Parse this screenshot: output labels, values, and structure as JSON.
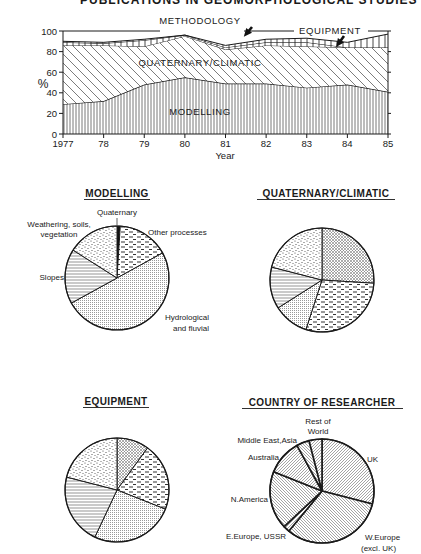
{
  "page": {
    "cropped_title": "PUBLICATIONS IN GEOMORPHOLOGICAL STUDIES"
  },
  "chart_data": [
    {
      "type": "area",
      "stacked": true,
      "title": "",
      "xlabel": "Year",
      "ylabel": "%",
      "ylim": [
        0,
        100
      ],
      "yticks": [
        0,
        20,
        40,
        60,
        80,
        100
      ],
      "categories": [
        "1977",
        "78",
        "79",
        "80",
        "81",
        "82",
        "83",
        "84",
        "85"
      ],
      "grid": false,
      "series": [
        {
          "name": "MODELLING",
          "pattern": "vertical-lines",
          "values": [
            29,
            32,
            48,
            55,
            49,
            49,
            45,
            48,
            41
          ]
        },
        {
          "name": "QUATERNARY/CLIMATIC",
          "pattern": "diagonal-lines",
          "values": [
            57,
            54,
            37,
            40,
            33,
            37,
            40,
            36,
            43
          ]
        },
        {
          "name": "METHODOLOGY",
          "pattern": "vertical-lines-band",
          "values": [
            3,
            2,
            6,
            1,
            2,
            3,
            4,
            0,
            0
          ]
        },
        {
          "name": "EQUIPMENT",
          "pattern": "vertical-lines-band",
          "values": [
            1,
            1,
            1,
            0,
            2,
            3,
            4,
            5,
            13
          ]
        }
      ],
      "cumulative_tops": {
        "MODELLING": [
          29,
          32,
          48,
          55,
          49,
          49,
          45,
          48,
          41
        ],
        "QUATERNARY/CLIMATIC": [
          86,
          86,
          85,
          95,
          82,
          86,
          85,
          84,
          84
        ],
        "METHODOLOGY": [
          89,
          88,
          91,
          96,
          84,
          89,
          89,
          84,
          84
        ],
        "EQUIPMENT": [
          90,
          89,
          92,
          96,
          86,
          92,
          93,
          89,
          97
        ]
      },
      "annotations": [
        {
          "text": "METHODOLOGY",
          "arrow": true
        },
        {
          "text": "EQUIPMENT",
          "arrow": true
        },
        {
          "text": "QUATERNARY/CLIMATIC",
          "arrow": false
        },
        {
          "text": "MODELLING",
          "arrow": false
        }
      ]
    },
    {
      "type": "pie",
      "title": "MODELLING",
      "slices": [
        {
          "label": "Quaternary",
          "value": 1,
          "pattern": "solid"
        },
        {
          "label": "Other processes",
          "value": 16,
          "pattern": "dashes"
        },
        {
          "label": "Hydrological and fluvial",
          "value": 50,
          "pattern": "fine-dots"
        },
        {
          "label": "Slopes",
          "value": 17,
          "pattern": "horizontal-lines"
        },
        {
          "label": "Weathering, soils, vegetation",
          "value": 16,
          "pattern": "stipple"
        }
      ]
    },
    {
      "type": "pie",
      "title": "QUATERNARY/CLIMATIC",
      "slices": [
        {
          "label": "Quaternary",
          "value": 26,
          "pattern": "crosshatch"
        },
        {
          "label": "Other processes",
          "value": 29,
          "pattern": "dashes"
        },
        {
          "label": "Hydrological and fluvial",
          "value": 11,
          "pattern": "fine-dots"
        },
        {
          "label": "Slopes",
          "value": 13,
          "pattern": "horizontal-lines"
        },
        {
          "label": "Weathering, soils, vegetation",
          "value": 21,
          "pattern": "stipple"
        }
      ]
    },
    {
      "type": "pie",
      "title": "EQUIPMENT",
      "slices": [
        {
          "label": "Quaternary",
          "value": 10,
          "pattern": "crosshatch"
        },
        {
          "label": "Other processes",
          "value": 21,
          "pattern": "dashes"
        },
        {
          "label": "Hydrological and fluvial",
          "value": 26,
          "pattern": "fine-dots"
        },
        {
          "label": "Slopes",
          "value": 22,
          "pattern": "horizontal-lines"
        },
        {
          "label": "Weathering, soils, vegetation",
          "value": 21,
          "pattern": "stipple"
        }
      ]
    },
    {
      "type": "pie",
      "title": "COUNTRY OF RESEARCHER",
      "slices": [
        {
          "label": "UK",
          "value": 29,
          "pattern": "diagonal-fine"
        },
        {
          "label": "W.Europe (excl. UK)",
          "value": 32,
          "pattern": "diagonal-fine"
        },
        {
          "label": "E.Europe, USSR",
          "value": 2,
          "pattern": "diagonal-fine"
        },
        {
          "label": "N.America",
          "value": 18,
          "pattern": "diagonal-fine"
        },
        {
          "label": "Australia",
          "value": 11,
          "pattern": "diagonal-fine"
        },
        {
          "label": "Middle East,Asia",
          "value": 4,
          "pattern": "diagonal-fine"
        },
        {
          "label": "Rest of World",
          "value": 4,
          "pattern": "diagonal-fine"
        }
      ]
    }
  ],
  "labels": {
    "area": {
      "methodology": "METHODOLOGY",
      "equipment": "EQUIPMENT",
      "quaternary": "QUATERNARY/CLIMATIC",
      "modelling": "MODELLING",
      "ylabel": "%",
      "xlabel": "Year"
    },
    "modelling_pie": {
      "title": "MODELLING",
      "quaternary": "Quaternary",
      "weathering_1": "Weathering, soils,",
      "weathering_2": "vegetation",
      "other": "Other processes",
      "slopes": "Slopes",
      "hydro_1": "Hydrological",
      "hydro_2": "and fluvial"
    },
    "quaternary_pie": {
      "title": "QUATERNARY/CLIMATIC"
    },
    "equipment_pie": {
      "title": "EQUIPMENT"
    },
    "country_pie": {
      "title": "COUNTRY OF RESEARCHER",
      "rest_1": "Rest of",
      "rest_2": "World",
      "mideast": "Middle East,Asia",
      "australia": "Australia",
      "namerica": "N.America",
      "eeurope": "E.Europe, USSR",
      "weurope_1": "W.Europe",
      "weurope_2": "(excl. UK)",
      "uk": "UK"
    }
  }
}
